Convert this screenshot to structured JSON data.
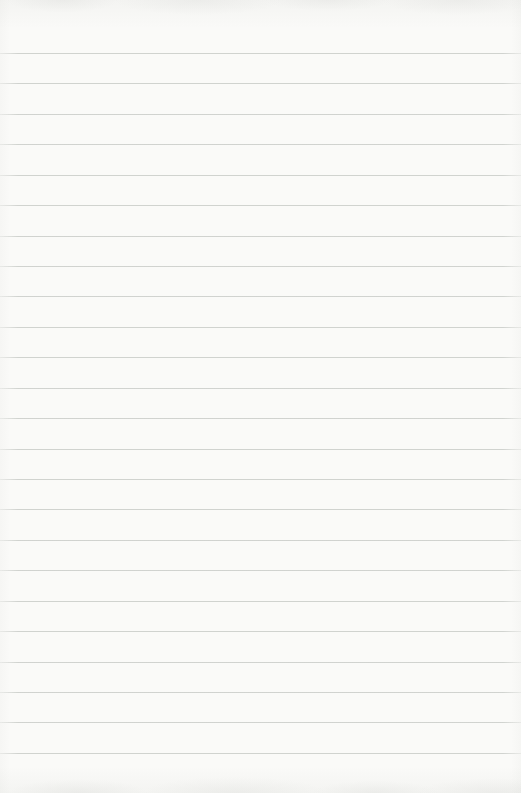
{
  "paper": {
    "kind": "blank-ruled-notebook-page",
    "text_content": "",
    "background_color": "#fafaf8",
    "rule_color": "#c9ccc8",
    "rule_count": 24,
    "first_rule_y_px": 53,
    "rule_spacing_px": 30.43,
    "width_px": 521,
    "height_px": 793
  }
}
